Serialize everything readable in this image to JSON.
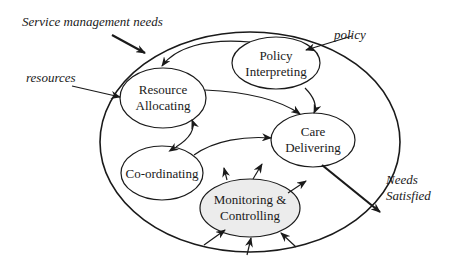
{
  "diagram": {
    "external_inputs": {
      "service_needs": "Service management needs",
      "resources": "resources",
      "policy": "policy"
    },
    "external_output": {
      "line1": "Needs",
      "line2": "Satisfied"
    },
    "processes": {
      "policy": {
        "line1": "Policy",
        "line2": "Interpreting"
      },
      "resource": {
        "line1": "Resource",
        "line2": "Allocating"
      },
      "care": {
        "line1": "Care",
        "line2": "Delivering"
      },
      "coord": {
        "line1": "Co-ordinating"
      },
      "monitor": {
        "line1": "Monitoring &",
        "line2": "Controlling"
      }
    },
    "colors": {
      "ink": "#1a1a1a",
      "monitor_fill": "#ececec",
      "background": "#ffffff"
    }
  }
}
